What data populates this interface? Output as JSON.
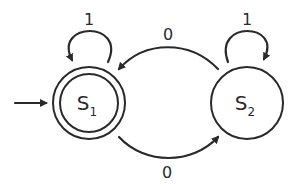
{
  "diagram": {
    "type": "finite-state-automaton",
    "colors": {
      "stroke": "#2a2a2a",
      "background": "#ffffff"
    },
    "start_state": "S1",
    "states": [
      {
        "id": "S1",
        "letter": "S",
        "subscript": "1",
        "accepting": true
      },
      {
        "id": "S2",
        "letter": "S",
        "subscript": "2",
        "accepting": false
      }
    ],
    "transitions": [
      {
        "from": "S1",
        "to": "S1",
        "label": "1"
      },
      {
        "from": "S2",
        "to": "S2",
        "label": "1"
      },
      {
        "from": "S2",
        "to": "S1",
        "label": "0"
      },
      {
        "from": "S1",
        "to": "S2",
        "label": "0"
      }
    ]
  }
}
